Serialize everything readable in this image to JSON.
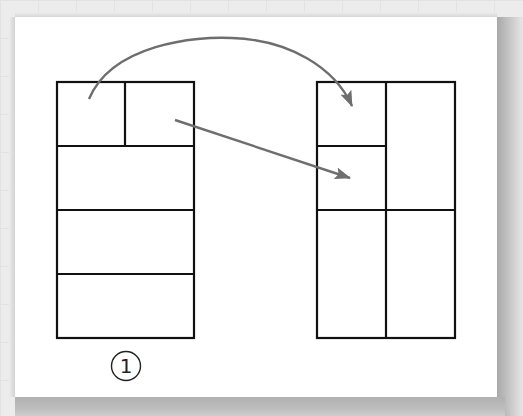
{
  "figure": {
    "label": "1",
    "label_glyph": "①",
    "colors": {
      "panel_background": "#ffffff",
      "outline": "#111111",
      "arrow": "#6e6e6e",
      "page_background": "#ececec"
    }
  },
  "layouts": [
    {
      "name": "left-layout",
      "description": "Tall box: top row split into two cells, followed by three full-width rows",
      "cells": [
        "top-left",
        "top-right",
        "row-2",
        "row-3",
        "row-4"
      ]
    },
    {
      "name": "right-layout",
      "description": "Tall box split into two columns; left column top split into two stacked cells, bottom row has two cells",
      "cells": [
        "upper-left",
        "middle-left",
        "tall-right",
        "bottom-left",
        "bottom-right"
      ]
    }
  ],
  "arrows": [
    {
      "name": "curved-arrow",
      "from": "left-layout.top-left",
      "to": "right-layout.upper-left"
    },
    {
      "name": "straight-arrow",
      "from": "left-layout.top-right",
      "to": "right-layout.middle-left"
    }
  ]
}
